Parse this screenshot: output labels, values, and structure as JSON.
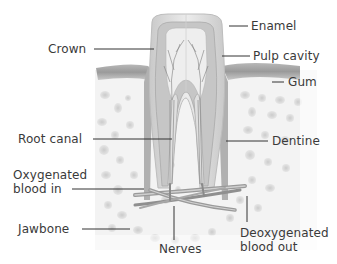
{
  "diagram": {
    "labels": {
      "enamel": "Enamel",
      "crown": "Crown",
      "pulp_cavity": "Pulp cavity",
      "gum": "Gum",
      "root_canal": "Root canal",
      "dentine": "Dentine",
      "oxygenated_blood_in": "Oxygenated\nblood in",
      "jawbone": "Jawbone",
      "nerves": "Nerves",
      "deoxygenated_blood_out": "Deoxygenated\nblood out"
    },
    "colors": {
      "label_text": "#3a3a3a",
      "leader_line": "#333333",
      "enamel": "#d9d9d9",
      "dentine": "#bdbdbd",
      "pulp": "#e8e8e8",
      "gum": "#a8a8a8",
      "bone_spots": "#cfcfcf",
      "vessels": "#8a8a8a"
    }
  }
}
